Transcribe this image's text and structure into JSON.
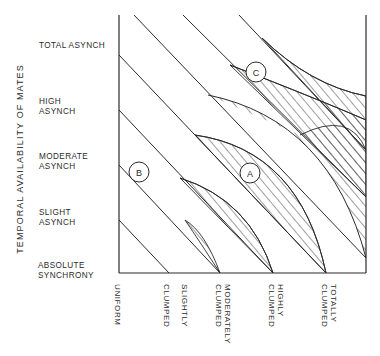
{
  "diagram": {
    "y_axis_title": "TEMPORAL AVAILABILITY OF MATES",
    "y_levels": [
      {
        "line1": "TOTAL ASYNCH",
        "line2": ""
      },
      {
        "line1": "HIGH",
        "line2": "ASYNCH"
      },
      {
        "line1": "MODERATE",
        "line2": "ASYNCH"
      },
      {
        "line1": "SLIGHT",
        "line2": "ASYNCH"
      },
      {
        "line1": "ABSOLUTE",
        "line2": "SYNCHRONY"
      }
    ],
    "x_levels": [
      {
        "line1": "UNIFORM",
        "line2": ""
      },
      {
        "line1": "SLIGHTLY",
        "line2": "CLUMPED"
      },
      {
        "line1": "MODERATELY",
        "line2": "CLUMPED"
      },
      {
        "line1": "HIGHLY",
        "line2": "CLUMPED"
      },
      {
        "line1": "TOTALLY",
        "line2": "CLUMPED"
      }
    ],
    "markers": [
      {
        "id": "A",
        "label": "A"
      },
      {
        "id": "B",
        "label": "B"
      },
      {
        "id": "C",
        "label": "C"
      }
    ],
    "colors": {
      "ink": "#2a2a2a",
      "background": "#ffffff"
    }
  }
}
